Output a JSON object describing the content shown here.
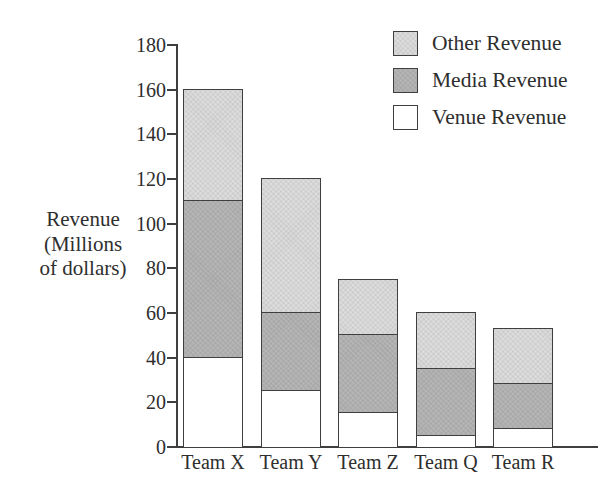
{
  "chart_data": {
    "type": "bar",
    "stacked": true,
    "title": "",
    "xlabel": "",
    "ylabel": "Revenue (Millions of dollars)",
    "ylabel_lines": [
      "Revenue",
      "(Millions",
      "of dollars)"
    ],
    "categories": [
      "Team X",
      "Team Y",
      "Team Z",
      "Team Q",
      "Team R"
    ],
    "series": [
      {
        "name": "Venue Revenue",
        "color": "#ffffff",
        "values": [
          40,
          25,
          15,
          5,
          8
        ]
      },
      {
        "name": "Media Revenue",
        "color": "#b5b5b5",
        "values": [
          70,
          35,
          35,
          30,
          20
        ]
      },
      {
        "name": "Other Revenue",
        "color": "#dcdcdc",
        "values": [
          50,
          60,
          25,
          25,
          25
        ]
      }
    ],
    "stack_totals": [
      160,
      120,
      75,
      60,
      53
    ],
    "y_ticks": [
      0,
      20,
      40,
      60,
      80,
      100,
      120,
      140,
      160,
      180
    ],
    "ylim": [
      0,
      180
    ],
    "grid": false,
    "legend_position": "top-right",
    "legend": [
      {
        "label": "Other Revenue",
        "color": "#dcdcdc"
      },
      {
        "label": "Media Revenue",
        "color": "#b5b5b5"
      },
      {
        "label": "Venue Revenue",
        "color": "#ffffff"
      }
    ]
  },
  "colors": {
    "axis": "#3f3f3f",
    "text": "#2e2e2e",
    "background": "#ffffff"
  }
}
